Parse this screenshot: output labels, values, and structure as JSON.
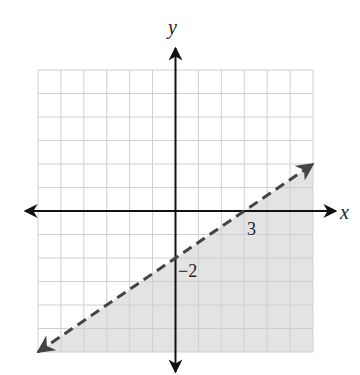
{
  "chart_data": {
    "type": "line",
    "title": "",
    "xlabel": "x",
    "ylabel": "y",
    "xlim": [
      -6,
      6
    ],
    "ylim": [
      -6,
      6
    ],
    "grid": true,
    "grid_step": 1,
    "series": [
      {
        "name": "boundary",
        "equation": "y = (2/3)x - 2",
        "style": "dashed",
        "x": [
          -6,
          0,
          3,
          6
        ],
        "y": [
          -6,
          -2,
          0,
          2
        ]
      }
    ],
    "shaded_region": {
      "inequality": "y < (2/3)x - 2",
      "side": "below",
      "polygon": [
        [
          -6,
          -6
        ],
        [
          6,
          2
        ],
        [
          6,
          -6
        ]
      ]
    },
    "annotations": [
      {
        "text": "3",
        "x": 3,
        "y": 0,
        "meaning": "x-intercept"
      },
      {
        "text": "−2",
        "x": 0,
        "y": -2,
        "meaning": "y-intercept"
      }
    ]
  },
  "labels": {
    "x_axis": "x",
    "y_axis": "y",
    "x_intercept": "3",
    "y_intercept": "−2"
  },
  "colors": {
    "grid": "#cfcfcf",
    "shade": "#e3e3e3",
    "axis": "#111111",
    "boundary": "#444444"
  }
}
